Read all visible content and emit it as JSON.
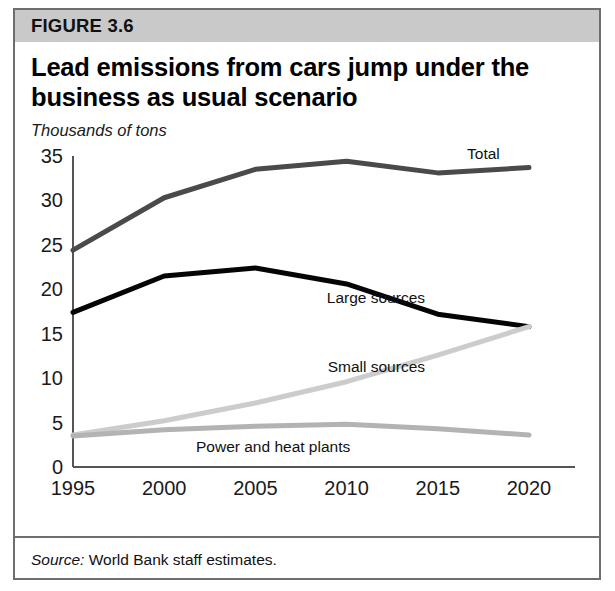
{
  "figure": {
    "number": "FIGURE 3.6",
    "title": "Lead emissions from cars jump under the business as usual scenario",
    "subtitle": "Thousands of tons",
    "source_label": "Source:",
    "source_text": "World Bank staff estimates."
  },
  "colors": {
    "header_band": "#c9c9c9",
    "border": "#6e6e6e",
    "total": "#4a4a4a",
    "large_sources": "#050505",
    "small_sources": "#cccccc",
    "power_and_heat": "#b3b3b3",
    "axis": "#555555",
    "text": "#111111"
  },
  "chart_data": {
    "type": "line",
    "title": "Lead emissions from cars jump under the business as usual scenario",
    "subtitle": "Thousands of tons",
    "xlabel": "",
    "ylabel": "Thousands of tons",
    "x": [
      1995,
      2000,
      2005,
      2010,
      2015,
      2020
    ],
    "categories": [
      "1995",
      "2000",
      "2005",
      "2010",
      "2015",
      "2020"
    ],
    "xlim": [
      1995,
      2020
    ],
    "ylim": [
      0,
      35
    ],
    "yticks": [
      0,
      5,
      10,
      15,
      20,
      25,
      30,
      35
    ],
    "ytick_labels": [
      "0",
      "5",
      "10",
      "15",
      "20",
      "25",
      "30",
      "35"
    ],
    "xticks": [
      1995,
      2000,
      2005,
      2010,
      2015,
      2020
    ],
    "xtick_labels": [
      "1995",
      "2000",
      "2005",
      "2010",
      "2015",
      "2020"
    ],
    "grid": false,
    "legend_position": "inline-right",
    "series": [
      {
        "name": "Total",
        "color": "#4a4a4a",
        "width": 5,
        "values": [
          24.4,
          30.3,
          33.5,
          34.4,
          33.1,
          33.7
        ]
      },
      {
        "name": "Large sources",
        "color": "#050505",
        "width": 5,
        "values": [
          17.4,
          21.5,
          22.4,
          20.6,
          17.2,
          15.8
        ]
      },
      {
        "name": "Small sources",
        "color": "#cccccc",
        "width": 5,
        "values": [
          3.6,
          5.2,
          7.2,
          9.6,
          12.6,
          15.8
        ]
      },
      {
        "name": "Power and heat plants",
        "color": "#b3b3b3",
        "width": 5,
        "values": [
          3.5,
          4.2,
          4.6,
          4.8,
          4.3,
          3.6
        ]
      }
    ],
    "annotations": [
      {
        "text": "Total",
        "x": 2018.4,
        "y": 35.2
      },
      {
        "text": "Large sources",
        "x": 2014.3,
        "y": 19.0
      },
      {
        "text": "Small sources",
        "x": 2014.3,
        "y": 11.2
      },
      {
        "text": "Power and heat plants",
        "x": 2010.2,
        "y": 2.3
      }
    ]
  }
}
